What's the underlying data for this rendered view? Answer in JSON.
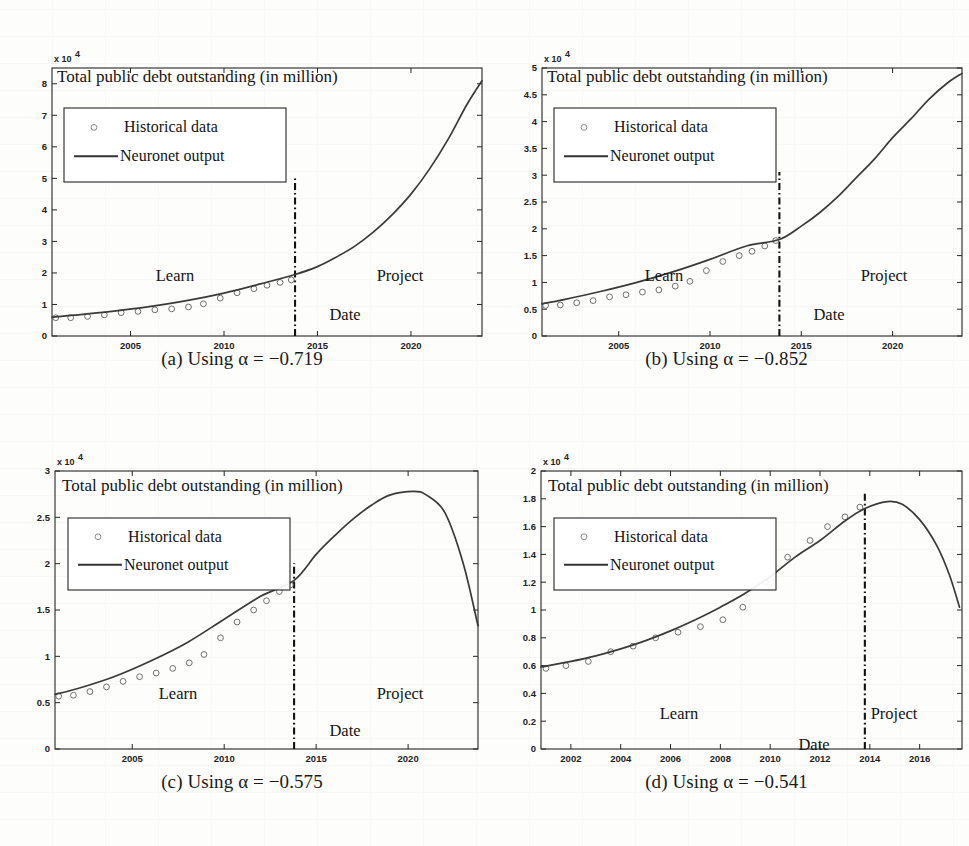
{
  "figure": {
    "panels": [
      {
        "id": "a",
        "caption_prefix": "(a) Using",
        "caption_alpha": "α",
        "caption_value": "= −0.719",
        "caption_full": "(a) Using α = −0.719",
        "chart_data": {
          "type": "line",
          "title": "Total public debt outstanding (in million)",
          "xlabel": "Date",
          "ylabel": "",
          "y_exponent_label": "x 10",
          "y_exponent_sup": "4",
          "xlim": [
            2000.8,
            2023.8
          ],
          "ylim": [
            0,
            8.5
          ],
          "xticks": [
            "2005",
            "2010",
            "2015",
            "2020"
          ],
          "xtick_values": [
            2005,
            2010,
            2015,
            2020
          ],
          "yticks": [
            "0",
            "1",
            "2",
            "3",
            "4",
            "5",
            "6",
            "7",
            "8"
          ],
          "ytick_values": [
            0,
            1,
            2,
            3,
            4,
            5,
            6,
            7,
            8
          ],
          "grid": false,
          "legend_position": "upper-left",
          "legend": [
            "Historical data",
            "Neuronet output"
          ],
          "annotations": [
            "Learn",
            "Project",
            "Date"
          ],
          "divider_x": 2013.8,
          "series": [
            {
              "name": "Historical data",
              "marker": "circle",
              "x": [
                2001.0,
                2001.8,
                2002.7,
                2003.6,
                2004.5,
                2005.4,
                2006.3,
                2007.2,
                2008.1,
                2008.9,
                2009.8,
                2010.7,
                2011.6,
                2012.3,
                2013.0,
                2013.6
              ],
              "values": [
                0.58,
                0.58,
                0.62,
                0.67,
                0.74,
                0.78,
                0.83,
                0.86,
                0.92,
                1.02,
                1.2,
                1.37,
                1.5,
                1.61,
                1.7,
                1.78
              ]
            },
            {
              "name": "Neuronet output",
              "marker": "line",
              "x": [
                2000.8,
                2002,
                2004,
                2006,
                2008,
                2010,
                2012,
                2013.8,
                2015,
                2016,
                2017,
                2018,
                2019,
                2020,
                2021,
                2022,
                2023,
                2023.8
              ],
              "values": [
                0.6,
                0.66,
                0.78,
                0.93,
                1.12,
                1.36,
                1.66,
                1.95,
                2.2,
                2.5,
                2.85,
                3.3,
                3.85,
                4.5,
                5.3,
                6.25,
                7.35,
                8.1
              ]
            }
          ]
        }
      },
      {
        "id": "b",
        "caption_prefix": "(b) Using",
        "caption_alpha": "α",
        "caption_value": "= −0.852",
        "caption_full": "(b) Using α = −0.852",
        "chart_data": {
          "type": "line",
          "title": "Total public debt outstanding (in million)",
          "xlabel": "Date",
          "ylabel": "",
          "y_exponent_label": "x 10",
          "y_exponent_sup": "4",
          "xlim": [
            2000.8,
            2023.8
          ],
          "ylim": [
            0,
            5
          ],
          "xticks": [
            "2005",
            "2010",
            "2015",
            "2020"
          ],
          "xtick_values": [
            2005,
            2010,
            2015,
            2020
          ],
          "yticks": [
            "0",
            "0.5",
            "1",
            "1.5",
            "2",
            "2.5",
            "3",
            "3.5",
            "4",
            "4.5",
            "5"
          ],
          "ytick_values": [
            0,
            0.5,
            1,
            1.5,
            2,
            2.5,
            3,
            3.5,
            4,
            4.5,
            5
          ],
          "grid": false,
          "legend_position": "upper-left",
          "legend": [
            "Historical data",
            "Neuronet output"
          ],
          "annotations": [
            "Learn",
            "Project",
            "Date"
          ],
          "divider_x": 2013.8,
          "series": [
            {
              "name": "Historical data",
              "marker": "circle",
              "x": [
                2001.0,
                2001.8,
                2002.7,
                2003.6,
                2004.5,
                2005.4,
                2006.3,
                2007.2,
                2008.1,
                2008.9,
                2009.8,
                2010.7,
                2011.6,
                2012.3,
                2013.0,
                2013.6
              ],
              "values": [
                0.57,
                0.58,
                0.62,
                0.66,
                0.73,
                0.77,
                0.82,
                0.86,
                0.93,
                1.02,
                1.22,
                1.39,
                1.5,
                1.58,
                1.68,
                1.78
              ]
            },
            {
              "name": "Neuronet output",
              "marker": "line",
              "x": [
                2000.8,
                2002,
                2004,
                2006,
                2008,
                2010,
                2012,
                2013.8,
                2015,
                2016,
                2017,
                2018,
                2019,
                2020,
                2021,
                2022,
                2023,
                2023.8
              ],
              "values": [
                0.6,
                0.68,
                0.83,
                1.0,
                1.2,
                1.43,
                1.68,
                1.8,
                2.05,
                2.3,
                2.6,
                2.95,
                3.3,
                3.7,
                4.05,
                4.42,
                4.72,
                4.9
              ]
            }
          ]
        }
      },
      {
        "id": "c",
        "caption_prefix": "(c) Using",
        "caption_alpha": "α",
        "caption_value": "= −0.575",
        "caption_full": "(c) Using α = −0.575",
        "chart_data": {
          "type": "line",
          "title": "Total public debt outstanding (in million)",
          "xlabel": "Date",
          "ylabel": "",
          "y_exponent_label": "x 10",
          "y_exponent_sup": "4",
          "xlim": [
            2000.8,
            2023.8
          ],
          "ylim": [
            0,
            3
          ],
          "xticks": [
            "2005",
            "2010",
            "2015",
            "2020"
          ],
          "xtick_values": [
            2005,
            2010,
            2015,
            2020
          ],
          "yticks": [
            "0",
            "0.5",
            "1",
            "1.5",
            "2",
            "2.5",
            "3"
          ],
          "ytick_values": [
            0,
            0.5,
            1,
            1.5,
            2,
            2.5,
            3
          ],
          "grid": false,
          "legend_position": "upper-left",
          "legend": [
            "Historical data",
            "Neuronet output"
          ],
          "annotations": [
            "Learn",
            "Project",
            "Date"
          ],
          "divider_x": 2013.8,
          "series": [
            {
              "name": "Historical data",
              "marker": "circle",
              "x": [
                2001.0,
                2001.8,
                2002.7,
                2003.6,
                2004.5,
                2005.4,
                2006.3,
                2007.2,
                2008.1,
                2008.9,
                2009.8,
                2010.7,
                2011.6,
                2012.3,
                2013.0,
                2013.6
              ],
              "values": [
                0.57,
                0.58,
                0.62,
                0.67,
                0.73,
                0.78,
                0.82,
                0.87,
                0.93,
                1.02,
                1.2,
                1.37,
                1.5,
                1.6,
                1.7,
                1.77
              ]
            },
            {
              "name": "Neuronet output",
              "marker": "line",
              "x": [
                2000.8,
                2002,
                2004,
                2006,
                2008,
                2010,
                2012,
                2013.8,
                2015,
                2016,
                2017,
                2018,
                2019,
                2020.3,
                2021,
                2022,
                2023,
                2023.8
              ],
              "values": [
                0.59,
                0.65,
                0.78,
                0.95,
                1.15,
                1.4,
                1.65,
                1.82,
                2.1,
                2.3,
                2.48,
                2.63,
                2.74,
                2.78,
                2.74,
                2.55,
                2.0,
                1.33
              ]
            }
          ]
        }
      },
      {
        "id": "d",
        "caption_prefix": "(d) Using",
        "caption_alpha": "α",
        "caption_value": "= −0.541",
        "caption_full": "(d) Using α = −0.541",
        "chart_data": {
          "type": "line",
          "title": "Total public debt outstanding (in million)",
          "xlabel": "Date",
          "ylabel": "",
          "y_exponent_label": "x 10",
          "y_exponent_sup": "4",
          "xlim": [
            2000.8,
            2017.7
          ],
          "ylim": [
            0,
            2
          ],
          "xticks": [
            "2002",
            "2004",
            "2006",
            "2008",
            "2010",
            "2012",
            "2014",
            "2016"
          ],
          "xtick_values": [
            2002,
            2004,
            2006,
            2008,
            2010,
            2012,
            2014,
            2016
          ],
          "yticks": [
            "0",
            "0.2",
            "0.4",
            "0.6",
            "0.8",
            "1",
            "1.2",
            "1.4",
            "1.6",
            "1.8",
            "2"
          ],
          "ytick_values": [
            0,
            0.2,
            0.4,
            0.6,
            0.8,
            1,
            1.2,
            1.4,
            1.6,
            1.8,
            2
          ],
          "grid": false,
          "legend_position": "upper-left",
          "legend": [
            "Historical data",
            "Neuronet output"
          ],
          "annotations": [
            "Learn",
            "Project",
            "Date"
          ],
          "divider_x": 2013.8,
          "series": [
            {
              "name": "Historical data",
              "marker": "circle",
              "x": [
                2001.0,
                2001.8,
                2002.7,
                2003.6,
                2004.5,
                2005.4,
                2006.3,
                2007.2,
                2008.1,
                2008.9,
                2009.8,
                2010.7,
                2011.6,
                2012.3,
                2013.0,
                2013.6
              ],
              "values": [
                0.58,
                0.6,
                0.63,
                0.7,
                0.74,
                0.8,
                0.84,
                0.88,
                0.93,
                1.02,
                1.2,
                1.38,
                1.5,
                1.6,
                1.67,
                1.74
              ]
            },
            {
              "name": "Neuronet output",
              "marker": "line",
              "x": [
                2000.8,
                2002,
                2003,
                2004,
                2005,
                2006,
                2007,
                2008,
                2009,
                2010,
                2011,
                2012,
                2013,
                2013.8,
                2014.7,
                2015.3,
                2016,
                2016.7,
                2017.2,
                2017.6
              ],
              "values": [
                0.59,
                0.63,
                0.67,
                0.72,
                0.78,
                0.85,
                0.93,
                1.02,
                1.12,
                1.24,
                1.38,
                1.5,
                1.64,
                1.73,
                1.78,
                1.76,
                1.65,
                1.46,
                1.25,
                1.02
              ]
            }
          ]
        }
      }
    ]
  }
}
